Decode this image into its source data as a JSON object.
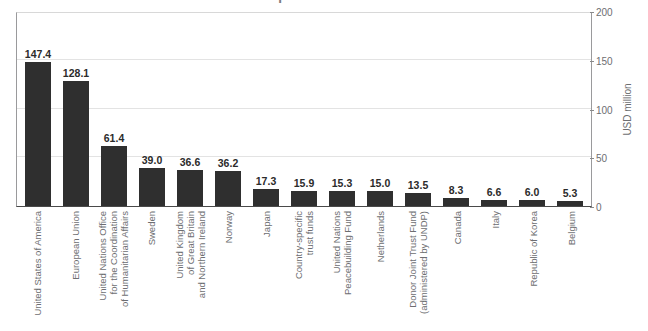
{
  "chart_data": {
    "type": "bar",
    "title": "resource partners in 2018",
    "xlabel": "",
    "ylabel": "USD million",
    "ylim": [
      0,
      200
    ],
    "yticks": [
      0,
      50,
      100,
      150,
      200
    ],
    "grid": true,
    "legend": "none",
    "bar_color": "#2f2f2f",
    "orientation": "vertical",
    "value_labels": true,
    "categories": [
      "United States of America",
      "European Union",
      "United Nations Office for the Coordination of Humanitarian Affairs",
      "Sweden",
      "United Kingdom of Great Britain and Northern Ireland",
      "Norway",
      "Japan",
      "Country-specific trust funds",
      "United Nations Peacebuilding Fund",
      "Netherlands",
      "Donor Joint Trust Fund (administered by UNDP)",
      "Canada",
      "Italy",
      "Republic of Korea",
      "Belgium"
    ],
    "category_lines": [
      [
        "United States of America"
      ],
      [
        "European Union"
      ],
      [
        "United Nations Office",
        "for the Coordination",
        "of Humanitarian Affairs"
      ],
      [
        "Sweden"
      ],
      [
        "United Kingdom",
        "of Great Britain",
        "and Northern Ireland"
      ],
      [
        "Norway"
      ],
      [
        "Japan"
      ],
      [
        "Country-specific",
        "trust funds"
      ],
      [
        "United Nations",
        "Peacebuilding Fund"
      ],
      [
        "Netherlands"
      ],
      [
        "Donor Joint Trust Fund",
        "(administered by UNDP)"
      ],
      [
        "Canada"
      ],
      [
        "Italy"
      ],
      [
        "Republic of Korea"
      ],
      [
        "Belgium"
      ]
    ],
    "values": [
      147.4,
      128.1,
      61.4,
      39.0,
      36.6,
      36.2,
      17.3,
      15.9,
      15.3,
      15.0,
      13.5,
      8.3,
      6.6,
      6.0,
      5.3
    ],
    "value_label_text": [
      "147.4",
      "128.1",
      "61.4",
      "39.0",
      "36.6",
      "36.2",
      "17.3",
      "15.9",
      "15.3",
      "15.0",
      "13.5",
      "8.3",
      "6.6",
      "6.0",
      "5.3"
    ],
    "ytick_labels": [
      "0",
      "50",
      "100",
      "150",
      "200"
    ]
  }
}
